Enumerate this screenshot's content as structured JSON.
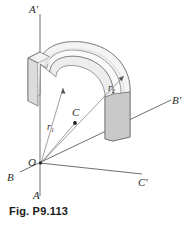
{
  "figure": {
    "caption": "Fig. P9.113",
    "type": "engineering-diagram",
    "colors": {
      "line": "#555555",
      "axis": "#4a4a4a",
      "text": "#2b2b2b",
      "caption": "#1a1a1a",
      "body_top": "#f4f4f4",
      "body_outer": "#fafafa",
      "body_inner": "#ededed",
      "end_face_left": "#e2e2e2",
      "end_face_right": "#c9c9c9",
      "outline": "#6e6e6e",
      "background": "#ffffff"
    },
    "labels": [
      {
        "id": "axis-a-prime",
        "text": "A'",
        "x": 29,
        "y": 4
      },
      {
        "id": "axis-a",
        "text": "A",
        "x": 33,
        "y": 190
      },
      {
        "id": "axis-b-prime",
        "text": "B'",
        "x": 172,
        "y": 95
      },
      {
        "id": "axis-b",
        "text": "B",
        "x": 7,
        "y": 172
      },
      {
        "id": "axis-c-prime",
        "text": "C'",
        "x": 138,
        "y": 177
      },
      {
        "id": "origin-o",
        "text": "O",
        "x": 28,
        "y": 157
      },
      {
        "id": "centroid-c",
        "text": "C",
        "x": 72,
        "y": 112
      }
    ],
    "radius_labels": [
      {
        "id": "radius-r1",
        "base": "r",
        "sub": "1",
        "x": 47,
        "y": 122
      },
      {
        "id": "radius-r2",
        "base": "r",
        "sub": "2",
        "x": 108,
        "y": 88
      }
    ]
  }
}
